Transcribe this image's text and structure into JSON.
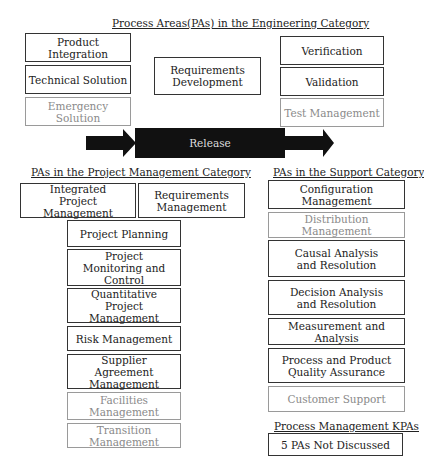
{
  "engineering": {
    "title": "Process Areas(PAs) in the Engineering Category",
    "left": [
      "Product Integration",
      "Technical Solution",
      "Emergency Solution"
    ],
    "center": "Requirements Development",
    "right": [
      "Verification",
      "Validation",
      "Test Management"
    ]
  },
  "release": {
    "label": "Release"
  },
  "project_management": {
    "title": "PAs in the Project Management Category",
    "items": [
      "Integrated Project Management",
      "Requirements Management",
      "Project Planning",
      "Project Monitoring and Control",
      "Quantitative Project Management",
      "Risk Management",
      "Supplier Agreement Management",
      "Facilities Management",
      "Transition Management"
    ]
  },
  "support": {
    "title": "PAs in the Support Category",
    "items": [
      "Configuration Management",
      "Distribution Management",
      "Causal Analysis and Resolution",
      "Decision Analysis and Resolution",
      "Measurement and Analysis",
      "Process and Product Quality Assurance",
      "Customer Support"
    ]
  },
  "process_management": {
    "title": "Process Management KPAs",
    "item": "5 PAs Not Discussed"
  },
  "colors": {
    "standard_border": "#333333",
    "added_border": "#9a9a9a",
    "added_text": "#8a8a8a",
    "release_fill": "#111111"
  }
}
